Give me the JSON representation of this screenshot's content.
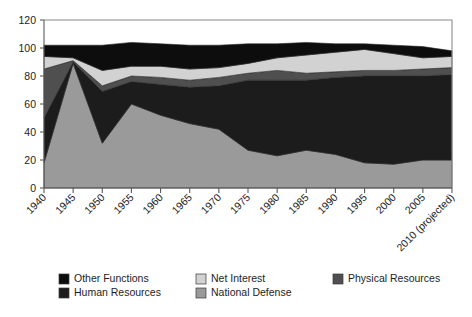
{
  "chart_data": {
    "type": "area",
    "stacked": true,
    "title": "",
    "subtitle": "",
    "xlabel": "",
    "ylabel": "",
    "ylim": [
      0,
      120
    ],
    "yticks": [
      0,
      20,
      40,
      60,
      80,
      100,
      120
    ],
    "grid": false,
    "legend_position": "bottom",
    "categories": [
      "1940",
      "1945",
      "1950",
      "1955",
      "1960",
      "1965",
      "1970",
      "1975",
      "1980",
      "1985",
      "1990",
      "1995",
      "2000",
      "2005",
      "2010 (projected)"
    ],
    "series": [
      {
        "name": "National Defense",
        "color": "#9a9a9a",
        "values": [
          18,
          89,
          32,
          60,
          52,
          46,
          42,
          27,
          23,
          27,
          24,
          18,
          17,
          20,
          20
        ]
      },
      {
        "name": "Human Resources",
        "color": "#1c1c1c",
        "values": [
          32,
          1,
          37,
          16,
          22,
          26,
          31,
          50,
          54,
          50,
          55,
          62,
          63,
          60,
          61
        ]
      },
      {
        "name": "Physical Resources",
        "color": "#4f4f4f",
        "values": [
          35,
          1,
          4,
          4,
          5,
          5,
          6,
          5,
          7,
          5,
          4,
          4,
          4,
          5,
          5
        ]
      },
      {
        "name": "Net Interest",
        "color": "#d2d2d2",
        "values": [
          9,
          2,
          11,
          7,
          8,
          8,
          7,
          7,
          9,
          13,
          14,
          15,
          12,
          8,
          8
        ]
      },
      {
        "name": "Other Functions",
        "color": "#0d0d0d",
        "values": [
          8,
          9,
          18,
          17,
          16,
          17,
          16,
          14,
          10,
          9,
          6,
          4,
          6,
          8,
          4
        ]
      }
    ]
  },
  "legend": {
    "items": [
      {
        "label": "Other Functions",
        "color": "#0d0d0d"
      },
      {
        "label": "Net Interest",
        "color": "#d2d2d2"
      },
      {
        "label": "Physical Resources",
        "color": "#4f4f4f"
      },
      {
        "label": "Human Resources",
        "color": "#1c1c1c"
      },
      {
        "label": "National Defense",
        "color": "#9a9a9a"
      }
    ]
  },
  "axes": {
    "y_tick_labels": [
      "0",
      "20",
      "40",
      "60",
      "80",
      "100",
      "120"
    ],
    "x_tick_labels": [
      "1940",
      "1945",
      "1950",
      "1955",
      "1960",
      "1965",
      "1970",
      "1975",
      "1980",
      "1985",
      "1990",
      "1995",
      "2000",
      "2005",
      "2010 (projected)"
    ]
  }
}
